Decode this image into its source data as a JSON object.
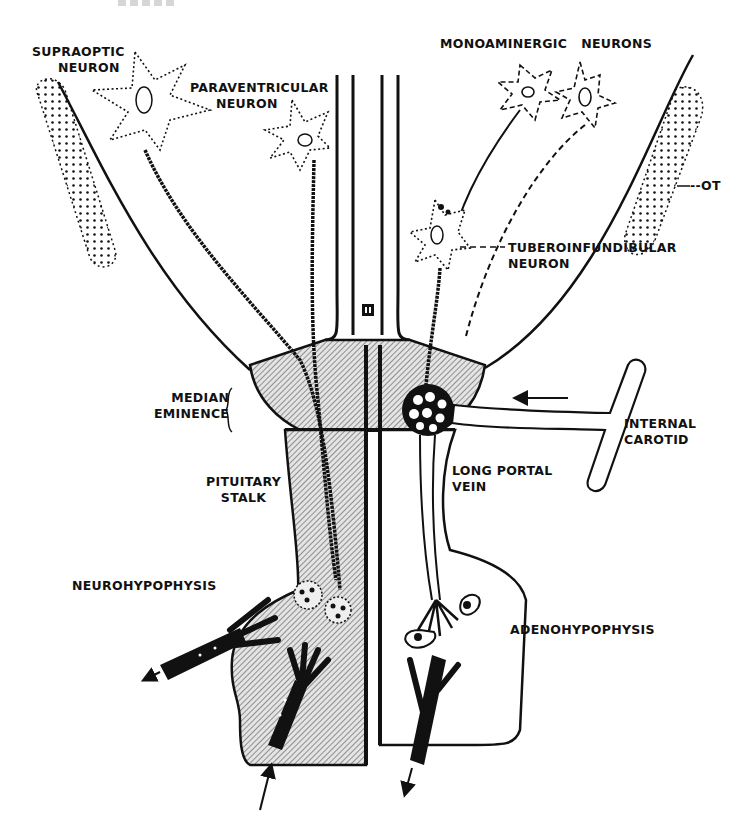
{
  "figure": {
    "title_fragment": "",
    "colors": {
      "ink": "#111111",
      "background": "#ffffff",
      "stipple": "#444444"
    },
    "labels": {
      "supraoptic": [
        "SUPRAOPTIC",
        "NEURON"
      ],
      "paraventricular": [
        "PARAVENTRICULAR",
        "NEURON"
      ],
      "monoaminergic": "MONOAMINERGIC   NEURONS",
      "ot": "--OT",
      "tuberoinfundibular": [
        "TUBEROINFUNDIBULAR",
        "NEURON"
      ],
      "median_eminence": [
        "MEDIAN",
        "EMINENCE"
      ],
      "internal_carotid": [
        "INTERNAL",
        "CAROTID"
      ],
      "long_portal_vein": [
        "LONG PORTAL",
        "VEIN"
      ],
      "pituitary_stalk": [
        "PITUITARY",
        "STALK"
      ],
      "neurohypophysis": "NEUROHYPOPHYSIS",
      "adenohypophysis": "ADENOHYPOPHYSIS",
      "third_ventricle": "III"
    }
  }
}
